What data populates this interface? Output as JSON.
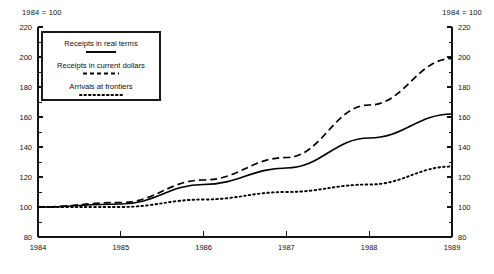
{
  "header": {
    "left_note": "1984 = 100",
    "right_note": "1984 = 100"
  },
  "legend": {
    "entries": [
      {
        "label": "Receipts in real terms",
        "style": "solid"
      },
      {
        "label": "Receipts in current dollars",
        "style": "dashed"
      },
      {
        "label": "Arrivals at frontiers",
        "style": "dotted"
      }
    ]
  },
  "axis": {
    "y_ticks": [
      "80",
      "100",
      "120",
      "140",
      "160",
      "180",
      "200",
      "220"
    ],
    "x_ticks": [
      "1984",
      "1985",
      "1986",
      "1987",
      "1988",
      "1989"
    ]
  },
  "chart_data": {
    "type": "line",
    "title": "",
    "subtitle": "",
    "xlabel": "",
    "ylabel": "",
    "note": "1984 = 100",
    "xlim": [
      1984,
      1989
    ],
    "ylim": [
      80,
      220
    ],
    "ytick_step": 20,
    "minor_ticks": true,
    "grid": false,
    "legend_position": "upper-left inside plot",
    "categories": [
      "1984",
      "1985",
      "1986",
      "1987",
      "1988",
      "1989"
    ],
    "x": [
      1984,
      1985,
      1986,
      1987,
      1988,
      1989
    ],
    "series": [
      {
        "name": "Receipts in real terms",
        "style": "solid",
        "color": "#000000",
        "values": [
          100,
          102,
          115,
          126,
          146,
          162
        ]
      },
      {
        "name": "Receipts in current dollars",
        "style": "dashed",
        "color": "#000000",
        "values": [
          100,
          103,
          118,
          133,
          168,
          199
        ]
      },
      {
        "name": "Arrivals at frontiers",
        "style": "dotted",
        "color": "#000000",
        "values": [
          100,
          100,
          105,
          110,
          115,
          127
        ]
      }
    ]
  }
}
